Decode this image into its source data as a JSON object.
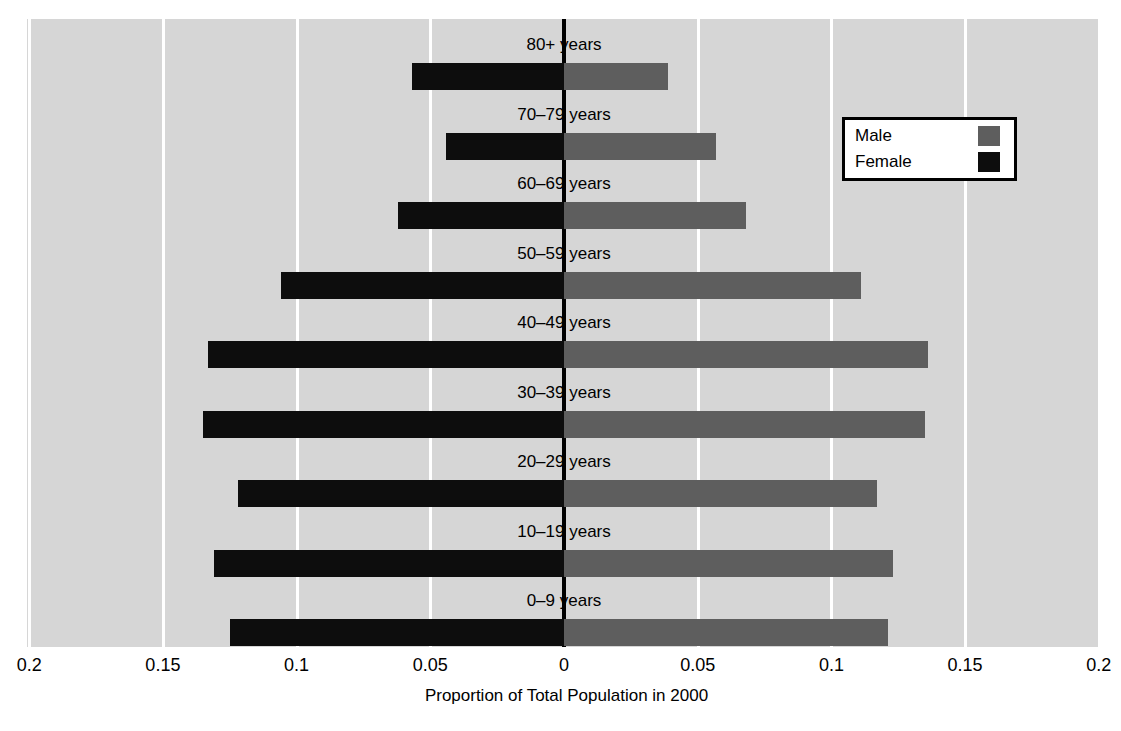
{
  "chart_data": {
    "type": "bar",
    "subtype": "population-pyramid",
    "title": "",
    "xlabel": "Proportion of Total Population in 2000",
    "ylabel": "",
    "orientation": "horizontal",
    "diverging": true,
    "categories": [
      "0–9 years",
      "10–19 years",
      "20–29 years",
      "30–39 years",
      "40–49 years",
      "50–59 years",
      "60–69 years",
      "70–79 years",
      "80+ years"
    ],
    "series": [
      {
        "name": "Male",
        "color": "#5e5e5e",
        "side": "right",
        "values": [
          0.121,
          0.123,
          0.117,
          0.135,
          0.136,
          0.111,
          0.068,
          0.057,
          0.039
        ]
      },
      {
        "name": "Female",
        "color": "#0d0d0d",
        "side": "left",
        "values": [
          0.125,
          0.131,
          0.122,
          0.135,
          0.133,
          0.106,
          0.062,
          0.044,
          0.057
        ]
      }
    ],
    "xlim": [
      -0.2,
      0.2
    ],
    "xticks": [
      -0.2,
      -0.15,
      -0.1,
      -0.05,
      0,
      0.05,
      0.1,
      0.15,
      0.2
    ],
    "xtick_labels": [
      "0.2",
      "0.15",
      "0.1",
      "0.05",
      "0",
      "0.05",
      "0.1",
      "0.15",
      "0.2"
    ],
    "grid": true,
    "gridline_color": "#ffffff",
    "plot_background": "#d6d6d6",
    "zero_axis_color": "#000000",
    "legend_position": "top-right"
  },
  "legend": {
    "entries": [
      {
        "label": "Male",
        "color": "#5e5e5e"
      },
      {
        "label": "Female",
        "color": "#0d0d0d"
      }
    ]
  },
  "axis": {
    "x_title": "Proportion of Total Population in 2000",
    "tick_labels": [
      "0.2",
      "0.15",
      "0.1",
      "0.05",
      "0",
      "0.05",
      "0.1",
      "0.15",
      "0.2"
    ]
  },
  "row_labels": [
    "80+ years",
    "70–79 years",
    "60–69 years",
    "50–59 years",
    "40–49 years",
    "30–39 years",
    "20–29 years",
    "10–19 years",
    "0–9 years"
  ]
}
